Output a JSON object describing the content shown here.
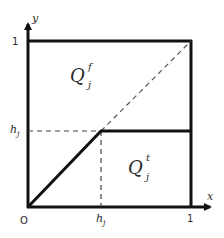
{
  "diagram": {
    "axes": {
      "x_label": "x",
      "y_label": "y",
      "origin_label": "O",
      "x_tick_one": "1",
      "y_tick_one": "1",
      "x_tick_h": "h",
      "x_tick_h_sub": "j",
      "y_tick_h": "h",
      "y_tick_h_sub": "j"
    },
    "regions": {
      "upper": {
        "main": "Q",
        "sup": "f",
        "sub": "j"
      },
      "lower": {
        "main": "Q",
        "sup": "t",
        "sub": "j"
      }
    },
    "colors": {
      "stroke": "#111111",
      "dashed": "#555555",
      "text": "#2a2a2a",
      "background": "#ffffff"
    }
  }
}
